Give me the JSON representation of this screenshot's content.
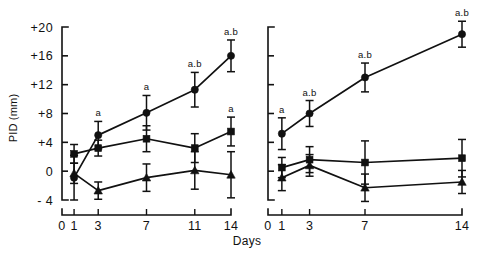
{
  "figure": {
    "ylabel": "PID (mm)",
    "xlabel": "Days",
    "y_ticks": [
      "+20",
      "+16",
      "+12",
      "+8",
      "+4",
      "0",
      "- 4"
    ],
    "y_values": [
      20,
      16,
      12,
      8,
      4,
      0,
      -4
    ],
    "ylim": [
      -4,
      20
    ],
    "background": "#ffffff",
    "ink": "#111111"
  },
  "chart_data": [
    {
      "type": "line",
      "panel": "left",
      "title": "",
      "xlabel": "Days",
      "ylabel": "PID (mm)",
      "ylim": [
        -4,
        20
      ],
      "grid": false,
      "legend": "none",
      "x": [
        1,
        3,
        7,
        11,
        14
      ],
      "x_tick_labels": [
        "0",
        "1",
        "3",
        "7",
        "11",
        "14"
      ],
      "x_tick_values": [
        0,
        1,
        3,
        7,
        11,
        14
      ],
      "series": [
        {
          "name": "series-1",
          "marker": "filled-circle",
          "values": [
            -0.9,
            5.0,
            8.1,
            11.3,
            16.0
          ],
          "errors": [
            3.1,
            1.9,
            2.4,
            2.4,
            2.2
          ],
          "annotations": [
            "",
            "a",
            "a",
            "a.b",
            "a.b"
          ]
        },
        {
          "name": "series-2",
          "marker": "filled-square",
          "values": [
            2.4,
            3.2,
            4.5,
            3.2,
            5.5
          ],
          "errors": [
            1.3,
            1.1,
            1.8,
            2.0,
            2.0
          ],
          "annotations": [
            "",
            "",
            "",
            "",
            "a"
          ]
        },
        {
          "name": "series-3",
          "marker": "filled-triangle",
          "values": [
            -0.3,
            -2.7,
            -0.9,
            0.1,
            -0.5
          ],
          "errors": [
            1.4,
            1.2,
            1.9,
            2.6,
            3.2
          ],
          "annotations": [
            "",
            "",
            "",
            "",
            ""
          ]
        }
      ]
    },
    {
      "type": "line",
      "panel": "right",
      "title": "",
      "xlabel": "Days",
      "ylabel": "",
      "ylim": [
        -4,
        20
      ],
      "grid": false,
      "legend": "none",
      "x": [
        1,
        3,
        7,
        14
      ],
      "x_tick_labels": [
        "0",
        "1",
        "3",
        "7",
        "14"
      ],
      "x_tick_values": [
        0,
        1,
        3,
        7,
        14
      ],
      "series": [
        {
          "name": "series-1",
          "marker": "filled-circle",
          "values": [
            5.2,
            8.0,
            13.0,
            19.0
          ],
          "errors": [
            2.2,
            1.8,
            2.0,
            1.8
          ],
          "annotations": [
            "a",
            "a.b",
            "a.b",
            "a.b"
          ]
        },
        {
          "name": "series-2",
          "marker": "filled-square",
          "values": [
            0.5,
            1.6,
            1.2,
            1.8
          ],
          "errors": [
            1.4,
            1.8,
            3.0,
            2.6
          ],
          "annotations": [
            "",
            "",
            "",
            ""
          ]
        },
        {
          "name": "series-3",
          "marker": "filled-triangle",
          "values": [
            -0.9,
            0.8,
            -2.3,
            -1.5
          ],
          "errors": [
            1.8,
            1.5,
            1.9,
            1.6
          ],
          "annotations": [
            "",
            "",
            "",
            ""
          ]
        }
      ]
    }
  ]
}
